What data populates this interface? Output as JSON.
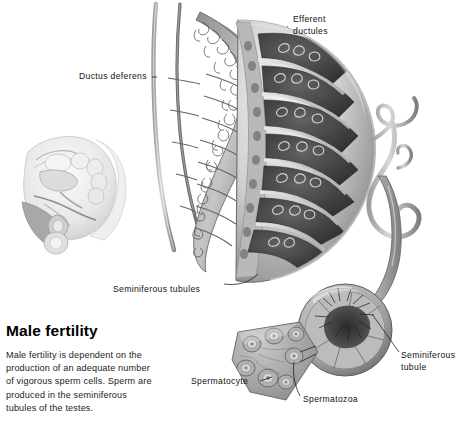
{
  "figure": {
    "title": "Male fertility",
    "body_text": "Male fertility is dependent on the production of an adequate number of vigorous sperm cells. Sperm are produced in the seminiferous tubules of the testes.",
    "background_color": "#ffffff",
    "ink_color": "#111111",
    "style": "grayscale medical illustration"
  },
  "labels": {
    "ductus_deferens": "Ductus deferens",
    "efferent_ductules_line1": "Efferent",
    "efferent_ductules_line2": "ductules",
    "seminiferous_tubules": "Seminiferous tubules",
    "seminiferous_tubule_line1": "Seminiferous",
    "seminiferous_tubule_line2": "tubule",
    "spermatocyte": "Spermatocyte",
    "spermatozoa": "Spermatozoa"
  },
  "illustrations": {
    "pelvic_inset": "male-pelvis-sagittal-section",
    "testis_section": "testis-cross-section-with-lobules",
    "epididymis": "coiled-epididymis",
    "vas_deferens": "ductus-deferens-tube",
    "tubule_cutaway": "seminiferous-tubule-cutaway",
    "tissue_wedge": "testis-tissue-wedge-with-tubule-cross-sections"
  }
}
